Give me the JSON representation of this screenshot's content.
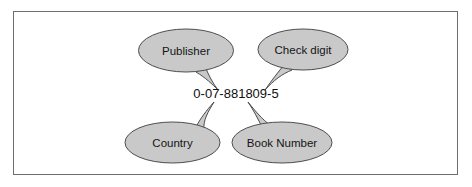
{
  "figure": {
    "background_color": "#ffffff",
    "frame_color": "#6e6e6e",
    "balloon_fill": "#c9c9c9",
    "balloon_stroke": "#4d4d4d",
    "text_color": "#141414"
  },
  "isbn": {
    "value": "0-07-881809-5"
  },
  "callouts": [
    {
      "id": "publisher",
      "label": "Publisher",
      "position": "top-left",
      "tail_direction": "down-right",
      "points_to": "07"
    },
    {
      "id": "check-digit",
      "label": "Check digit",
      "position": "top-right",
      "tail_direction": "down-left",
      "points_to": "5"
    },
    {
      "id": "country",
      "label": "Country",
      "position": "bottom-left",
      "tail_direction": "up-right",
      "points_to": "0"
    },
    {
      "id": "book-number",
      "label": "Book Number",
      "position": "bottom-right",
      "tail_direction": "up-left",
      "points_to": "881809"
    }
  ]
}
